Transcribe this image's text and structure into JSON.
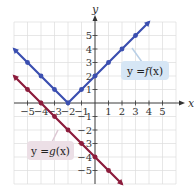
{
  "chart_data": {
    "type": "line",
    "title": "",
    "xlabel": "x",
    "ylabel": "y",
    "xlim": [
      -6,
      6
    ],
    "ylim": [
      -6,
      6
    ],
    "grid": true,
    "x_ticks": [
      -5,
      -4,
      -3,
      -2,
      -1,
      1,
      2,
      3,
      4,
      5
    ],
    "y_ticks": [
      5,
      4,
      3,
      2,
      1,
      -1,
      -2,
      -3,
      -4,
      -5
    ],
    "series": [
      {
        "name": "y = f(x)",
        "color": "#3b4fb0",
        "points": [
          [
            -6,
            4
          ],
          [
            -5,
            3
          ],
          [
            -4,
            2
          ],
          [
            -3,
            1
          ],
          [
            -2,
            0
          ],
          [
            -1,
            1
          ],
          [
            0,
            2
          ],
          [
            1,
            3
          ],
          [
            2,
            4
          ],
          [
            3,
            5
          ],
          [
            4,
            6
          ]
        ],
        "marked_points": [
          [
            -5,
            3
          ],
          [
            -4,
            2
          ],
          [
            -3,
            1
          ],
          [
            -2,
            0
          ],
          [
            -1,
            1
          ],
          [
            0,
            2
          ],
          [
            1,
            3
          ],
          [
            2,
            4
          ],
          [
            3,
            5
          ]
        ],
        "arrows": "both",
        "label_box_color": "#d6e6f5"
      },
      {
        "name": "y = g(x)",
        "color": "#8c1c3c",
        "points": [
          [
            -6,
            2
          ],
          [
            -5,
            1
          ],
          [
            -4,
            0
          ],
          [
            -3,
            -1
          ],
          [
            -2,
            -2
          ],
          [
            -1,
            -3
          ],
          [
            0,
            -4
          ],
          [
            1,
            -5
          ],
          [
            2,
            -6
          ]
        ],
        "marked_points": [
          [
            -5,
            1
          ],
          [
            -4,
            0
          ],
          [
            -3,
            -1
          ],
          [
            -2,
            -2
          ],
          [
            -1,
            -3
          ],
          [
            0,
            -4
          ],
          [
            1,
            -5
          ]
        ],
        "arrows": "both",
        "label_box_color": "#ecdfe6"
      }
    ],
    "annotations": [
      "y = f(x)",
      "y = g(x)"
    ]
  },
  "labels": {
    "x_axis": "x",
    "y_axis": "y",
    "f_label_prefix": "y = ",
    "f_label_fn": "f",
    "f_label_arg": "(x)",
    "g_label_prefix": "y = ",
    "g_label_fn": "g",
    "g_label_arg": "(x)"
  }
}
